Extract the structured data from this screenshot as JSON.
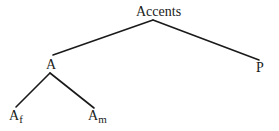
{
  "diagram": {
    "type": "tree",
    "nodes": {
      "root": {
        "label": "Accents"
      },
      "a": {
        "label": "A"
      },
      "p": {
        "label": "P"
      },
      "af": {
        "label": "A",
        "subscript": "f"
      },
      "am": {
        "label": "A",
        "subscript": "m"
      }
    },
    "edges": [
      {
        "from": "Accents",
        "to": "A"
      },
      {
        "from": "Accents",
        "to": "P"
      },
      {
        "from": "A",
        "to": "Af"
      },
      {
        "from": "A",
        "to": "Am"
      }
    ],
    "line_color": "#1a1a1a",
    "text_color": "#1a1a1a"
  }
}
